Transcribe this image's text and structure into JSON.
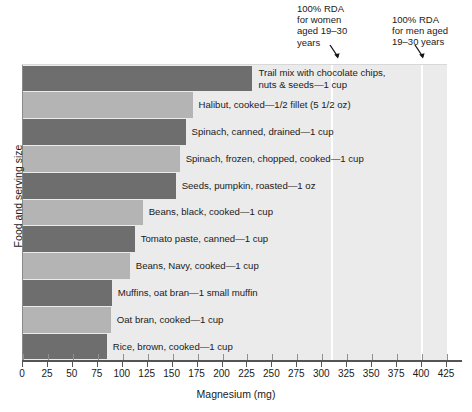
{
  "chart_data": {
    "type": "bar",
    "orientation": "horizontal",
    "title": "",
    "xlabel": "Magnesium (mg)",
    "ylabel": "Food and serving size",
    "xlim": [
      0,
      425
    ],
    "xticks": [
      0,
      25,
      50,
      75,
      100,
      125,
      150,
      175,
      200,
      225,
      250,
      275,
      300,
      325,
      350,
      375,
      400,
      425
    ],
    "grid": false,
    "legend": "none",
    "categories": [
      "Trail mix with chocolate chips, nuts & seeds—1 cup",
      "Halibut, cooked—1/2 fillet (5 1/2 oz)",
      "Spinach, canned, drained—1 cup",
      "Spinach, frozen, chopped, cooked—1 cup",
      "Seeds, pumpkin, roasted—1 oz",
      "Beans, black, cooked—1 cup",
      "Tomato paste, canned—1 cup",
      "Beans, Navy, cooked—1 cup",
      "Muffins, oat bran—1 small muffin",
      "Oat bran, cooked—1 cup",
      "Rice, brown, cooked—1 cup"
    ],
    "values": [
      230,
      170,
      163,
      157,
      153,
      120,
      112,
      107,
      89,
      88,
      84
    ],
    "bar_colors": [
      "#6e6e6e",
      "#b4b4b4",
      "#6e6e6e",
      "#b4b4b4",
      "#6e6e6e",
      "#b4b4b4",
      "#6e6e6e",
      "#b4b4b4",
      "#6e6e6e",
      "#b4b4b4",
      "#6e6e6e"
    ],
    "annotations": [
      {
        "name": "rda-women",
        "text": "100% RDA\nfor women\naged 19–30\nyears",
        "value": 310
      },
      {
        "name": "rda-men",
        "text": "100% RDA\nfor men aged\n19–30 years",
        "value": 400
      }
    ],
    "reference_lines": [
      {
        "name": "rda-women-line",
        "value": 310,
        "color": "#ffffff"
      },
      {
        "name": "rda-men-line",
        "value": 400,
        "color": "#ffffff"
      }
    ],
    "plot_background": "#ebebeb"
  },
  "bar_labels": [
    "Trail mix with chocolate chips,\nnuts & seeds—1 cup",
    "Halibut, cooked—1/2 fillet (5 1/2 oz)",
    "Spinach, canned, drained—1 cup",
    "Spinach, frozen, chopped, cooked—1 cup",
    "Seeds, pumpkin, roasted—1 oz",
    "Beans, black, cooked—1 cup",
    "Tomato paste, canned—1 cup",
    "Beans, Navy, cooked—1 cup",
    "Muffins, oat bran—1 small muffin",
    "Oat bran, cooked—1 cup",
    "Rice, brown, cooked—1 cup"
  ],
  "axis": {
    "x_title": "Magnesium (mg)",
    "y_title": "Food and serving size",
    "x_tick_labels": [
      "0",
      "25",
      "50",
      "75",
      "100",
      "125",
      "150",
      "175",
      "200",
      "225",
      "250",
      "275",
      "300",
      "325",
      "350",
      "375",
      "400",
      "425"
    ]
  },
  "annotations": {
    "women": "100% RDA\nfor women\naged 19–30\nyears",
    "men": "100% RDA\nfor men aged\n19–30 years"
  }
}
